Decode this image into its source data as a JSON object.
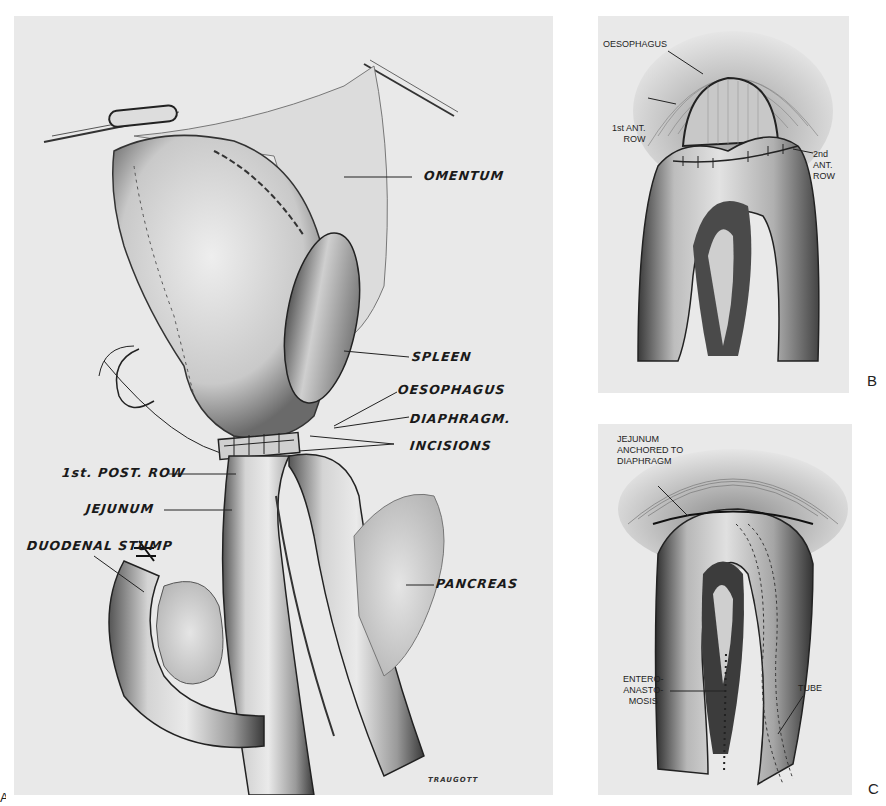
{
  "figure": {
    "panels": [
      {
        "id": "A",
        "letter": "A",
        "labels": {
          "omentum": "OMENTUM",
          "spleen": "SPLEEN",
          "oesophagus": "OESOPHAGUS",
          "diaphragm": "DIAPHRAGM.",
          "incisions": "INCISIONS",
          "post_row": "1st. POST. ROW",
          "jejunum": "JEJUNUM",
          "duodenal_stump": "DUODENAL STUMP",
          "pancreas": "PANCREAS"
        },
        "signature": "TRAUGOTT"
      },
      {
        "id": "B",
        "letter": "B",
        "labels": {
          "oesophagus": "OESOPHAGUS",
          "first_ant_row": "1st ANT.\nROW",
          "second_ant_row": "2nd\nANT.\nROW"
        }
      },
      {
        "id": "C",
        "letter": "C",
        "labels": {
          "jejunum_anchored": "JEJUNUM\nANCHORED TO\nDIAPHRAGM",
          "entero_anastomosis": "ENTERO-\nANASTO-\nMOSIS",
          "tube": "TUBE"
        }
      }
    ]
  },
  "colors": {
    "paper": "#e9e9e9",
    "ink": "#1a1a1a",
    "tissue_light": "#d8d8d8",
    "tissue_mid": "#a8a8a8",
    "tissue_dark": "#4a4a4a"
  }
}
